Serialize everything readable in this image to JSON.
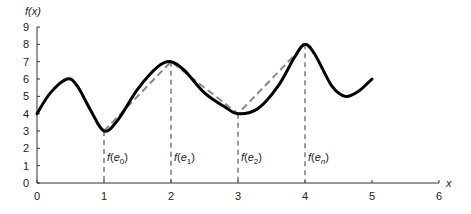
{
  "chart_data": {
    "type": "line",
    "title": "",
    "xlabel": "x",
    "ylabel": "f(x)",
    "xlim": [
      0,
      6
    ],
    "ylim": [
      0,
      9
    ],
    "grid": false,
    "x_ticks": [
      "0",
      "1",
      "2",
      "3",
      "4",
      "5",
      "6"
    ],
    "y_ticks": [
      "0",
      "1",
      "2",
      "3",
      "4",
      "5",
      "6",
      "7",
      "8",
      "9"
    ],
    "series": [
      {
        "name": "f(x)",
        "style": "solid-thick",
        "color": "#000000",
        "points": [
          [
            0,
            4
          ],
          [
            0.2,
            5.2
          ],
          [
            0.45,
            6
          ],
          [
            0.6,
            5.6
          ],
          [
            0.8,
            4.2
          ],
          [
            1,
            3
          ],
          [
            1.2,
            3.6
          ],
          [
            1.5,
            5.4
          ],
          [
            1.8,
            6.7
          ],
          [
            2,
            7
          ],
          [
            2.2,
            6.5
          ],
          [
            2.5,
            5.2
          ],
          [
            2.8,
            4.4
          ],
          [
            3,
            4
          ],
          [
            3.3,
            4.3
          ],
          [
            3.6,
            5.6
          ],
          [
            3.85,
            7.3
          ],
          [
            4,
            8
          ],
          [
            4.15,
            7.4
          ],
          [
            4.4,
            5.6
          ],
          [
            4.6,
            5
          ],
          [
            4.8,
            5.3
          ],
          [
            5,
            6
          ]
        ]
      },
      {
        "name": "linear approximation",
        "style": "dashed",
        "color": "#888888",
        "points": [
          [
            1,
            3
          ],
          [
            2,
            7
          ],
          [
            3,
            4
          ],
          [
            4,
            8
          ]
        ]
      }
    ],
    "annotations": [
      {
        "x": 1,
        "y": 3,
        "label_main": "f(e",
        "label_sub": "0",
        "label_end": ")"
      },
      {
        "x": 2,
        "y": 7,
        "label_main": "f(e",
        "label_sub": "1",
        "label_end": ")"
      },
      {
        "x": 3,
        "y": 4,
        "label_main": "f(e",
        "label_sub": "2",
        "label_end": ")"
      },
      {
        "x": 4,
        "y": 8,
        "label_main": "f(e",
        "label_sub": "n",
        "label_end": ")"
      }
    ]
  }
}
